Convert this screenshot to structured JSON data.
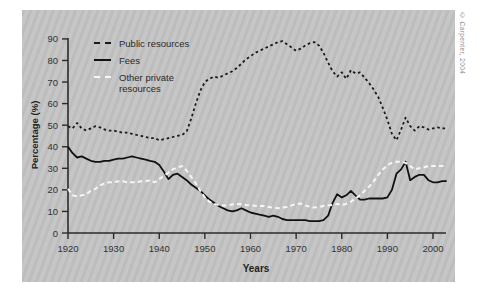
{
  "page": {
    "copyright": "© Carpenter, 2004"
  },
  "chart_data": {
    "type": "line",
    "title": "",
    "xlabel": "Years",
    "ylabel": "Percentage (%)",
    "xlim": [
      1920,
      2003
    ],
    "ylim": [
      0,
      90
    ],
    "grid": false,
    "legend_position": "top-left",
    "panel_background": "#c0c0c0",
    "x_ticks": [
      1920,
      1930,
      1940,
      1950,
      1960,
      1970,
      1980,
      1990,
      2000
    ],
    "y_ticks": [
      0,
      10,
      20,
      30,
      40,
      50,
      60,
      70,
      80,
      90
    ],
    "x": [
      1920,
      1921,
      1922,
      1923,
      1924,
      1925,
      1926,
      1927,
      1928,
      1929,
      1930,
      1931,
      1932,
      1933,
      1934,
      1935,
      1936,
      1937,
      1938,
      1939,
      1940,
      1941,
      1942,
      1943,
      1944,
      1945,
      1946,
      1947,
      1948,
      1949,
      1950,
      1951,
      1952,
      1953,
      1954,
      1955,
      1956,
      1957,
      1958,
      1959,
      1960,
      1961,
      1962,
      1963,
      1964,
      1965,
      1966,
      1967,
      1968,
      1969,
      1970,
      1971,
      1972,
      1973,
      1974,
      1975,
      1976,
      1977,
      1978,
      1979,
      1980,
      1981,
      1982,
      1983,
      1984,
      1985,
      1986,
      1987,
      1988,
      1989,
      1990,
      1991,
      1992,
      1993,
      1994,
      1995,
      1996,
      1997,
      1998,
      1999,
      2000,
      2001,
      2002,
      2003
    ],
    "series": [
      {
        "name": "Public resources",
        "style": "dashed",
        "color": "#1a1a1a",
        "values": [
          49.5,
          48.5,
          51,
          48.5,
          47.5,
          48.5,
          49.5,
          49,
          48,
          47.5,
          47.5,
          47,
          46.5,
          46.5,
          46,
          45.5,
          45,
          44.5,
          44,
          44,
          43,
          43.5,
          44,
          44.5,
          45,
          45.5,
          47,
          53,
          60,
          66,
          70,
          71.5,
          72.5,
          72,
          73,
          74,
          75,
          76.5,
          78.5,
          80.5,
          82,
          83.5,
          84.5,
          85.5,
          86.5,
          87.5,
          88.5,
          89,
          87.5,
          86,
          84.5,
          85.5,
          87,
          88,
          88.5,
          87,
          83.5,
          79,
          75,
          72.5,
          74.5,
          71.5,
          75.5,
          74,
          74.5,
          72,
          69.5,
          66.5,
          63,
          58,
          52.5,
          46,
          43,
          48,
          53.5,
          49.5,
          47.5,
          49.5,
          49,
          48,
          48.5,
          49,
          48.5,
          48.5
        ]
      },
      {
        "name": "Fees",
        "style": "solid",
        "color": "#111111",
        "values": [
          40,
          37,
          35,
          35.5,
          34.5,
          33.5,
          33,
          33,
          33.5,
          33.5,
          34,
          34.5,
          34.5,
          35,
          35.5,
          35,
          34.5,
          34,
          33.5,
          33,
          31.5,
          28.5,
          25,
          27,
          27.5,
          26,
          24.5,
          22.5,
          21,
          19.5,
          17.5,
          15.5,
          14,
          12.5,
          11.5,
          10.5,
          10,
          10.5,
          11.5,
          10.5,
          9.5,
          9,
          8.5,
          8,
          7.5,
          8,
          7.5,
          6.5,
          6,
          6,
          6,
          6,
          6,
          5.5,
          5.5,
          5.5,
          6,
          8,
          14,
          18,
          16.5,
          17.5,
          19.5,
          17.5,
          15.5,
          15.5,
          16,
          16,
          16,
          16,
          16.5,
          20,
          27.5,
          29.5,
          33,
          24.5,
          26,
          27,
          27,
          24.5,
          23.5,
          23.5,
          24,
          24
        ]
      },
      {
        "name": "Other private resources",
        "style": "dashed",
        "color": "#f7f7f2",
        "values": [
          20.5,
          17.5,
          17,
          17.5,
          18,
          19.5,
          20.5,
          22,
          23,
          23.5,
          23.5,
          24,
          24,
          23.5,
          23.5,
          23.5,
          24,
          24,
          24.5,
          23.5,
          25,
          26.5,
          28,
          29.5,
          30.5,
          31,
          29,
          26,
          23,
          19.5,
          16.5,
          14.5,
          13.5,
          13,
          12.8,
          12.8,
          13.2,
          13.5,
          13.3,
          13,
          12.8,
          12.6,
          12.5,
          12.5,
          12,
          11.8,
          11.5,
          11.8,
          12,
          12.8,
          13.4,
          13.7,
          12.8,
          12.2,
          11.8,
          12,
          12.5,
          12.8,
          13,
          13.5,
          13,
          13.5,
          14.5,
          16,
          17.5,
          19.5,
          21.5,
          24,
          27,
          29.5,
          31.5,
          32.5,
          33,
          33,
          32.5,
          31,
          29.5,
          30,
          30.5,
          31,
          31,
          31,
          31,
          31
        ]
      }
    ]
  }
}
